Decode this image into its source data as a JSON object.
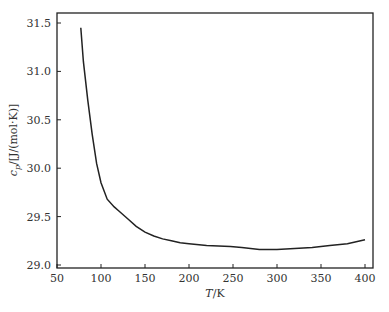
{
  "chart_data": {
    "type": "line",
    "title": "",
    "xlabel": "T/K",
    "ylabel": "c_p/[J/(mol·K)]",
    "xlim": [
      50,
      410
    ],
    "ylim": [
      28.97,
      31.6
    ],
    "xticks": [
      50,
      100,
      150,
      200,
      250,
      300,
      350,
      400
    ],
    "yticks": [
      29.0,
      29.5,
      30.0,
      30.5,
      31.0,
      31.5
    ],
    "xtick_labels": [
      "50",
      "100",
      "150",
      "200",
      "250",
      "300",
      "350",
      "400"
    ],
    "ytick_labels": [
      "29.0",
      "29.5",
      "30.0",
      "30.5",
      "31.0",
      "31.5"
    ],
    "grid": false,
    "legend": null,
    "series": [
      {
        "name": "c_p",
        "x": [
          77,
          80,
          85,
          90,
          95,
          100,
          107,
          115,
          120,
          130,
          140,
          150,
          160,
          170,
          180,
          190,
          200,
          220,
          247,
          260,
          280,
          300,
          320,
          340,
          360,
          380,
          400
        ],
        "y": [
          31.45,
          31.1,
          30.7,
          30.35,
          30.05,
          29.85,
          29.68,
          29.6,
          29.56,
          29.48,
          29.4,
          29.34,
          29.3,
          29.27,
          29.25,
          29.23,
          29.22,
          29.2,
          29.19,
          29.18,
          29.16,
          29.16,
          29.17,
          29.18,
          29.2,
          29.22,
          29.26
        ]
      }
    ]
  }
}
